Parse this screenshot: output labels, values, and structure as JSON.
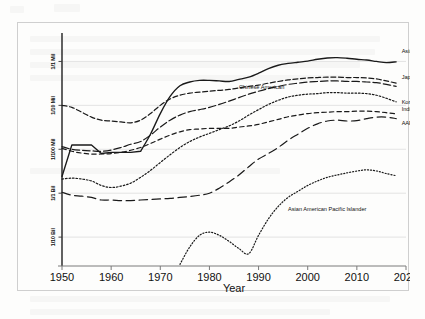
{
  "chart_data": {
    "type": "line",
    "title": "",
    "xlabel": "Year",
    "ylabel": "",
    "yscale": "log",
    "grid": true,
    "legend_position": "inline-right",
    "xlim": [
      1950,
      2020
    ],
    "xticks": [
      "1950",
      "1960",
      "1970",
      "1980",
      "1990",
      "2000",
      "2010",
      "2020"
    ],
    "yticks": [
      "1/1 Mil",
      "1/10 Mil",
      "1/100 Mil",
      "1/1 Bil",
      "1/10 Bil"
    ],
    "ytick_values": [
      1e-06,
      1e-07,
      1e-08,
      1e-09,
      1e-10
    ],
    "x": [
      1950,
      1952,
      1954,
      1956,
      1958,
      1960,
      1962,
      1964,
      1966,
      1968,
      1970,
      1972,
      1974,
      1976,
      1978,
      1980,
      1982,
      1984,
      1986,
      1988,
      1990,
      1992,
      1994,
      1996,
      1998,
      2000,
      2002,
      2004,
      2006,
      2008,
      2010,
      2012,
      2014,
      2016,
      2018
    ],
    "series": [
      {
        "name": "Asian American",
        "dash": "solid",
        "label_x": 2019,
        "values": [
          2.4e-09,
          1.25e-08,
          1.25e-08,
          1.25e-08,
          8e-09,
          8.5e-09,
          8.5e-09,
          8.5e-09,
          9e-09,
          2.2e-08,
          6.5e-08,
          1.6e-07,
          2.8e-07,
          3.4e-07,
          3.7e-07,
          3.7e-07,
          3.6e-07,
          3.5e-07,
          3.9e-07,
          4.4e-07,
          5.4e-07,
          6.9e-07,
          8.2e-07,
          9e-07,
          9.6e-07,
          1.02e-06,
          1.12e-06,
          1.2e-06,
          1.22e-06,
          1.18e-06,
          1.12e-06,
          1.08e-06,
          1e-06,
          9.4e-07,
          9.8e-07
        ]
      },
      {
        "name": "Chinese American",
        "dash": "dashed",
        "label_x": 1985,
        "values": [
          1e-07,
          9e-08,
          7e-08,
          5.4e-08,
          4.6e-08,
          4.4e-08,
          4.2e-08,
          4e-08,
          4.6e-08,
          6.5e-08,
          1e-07,
          1.4e-07,
          1.7e-07,
          1.9e-07,
          2e-07,
          2.1e-07,
          2.2e-07,
          2.3e-07,
          2.5e-07,
          2.7e-07,
          2.9e-07,
          3.2e-07,
          3.5e-07,
          3.8e-07,
          4e-07,
          4.2e-07,
          4.3e-07,
          4.4e-07,
          4.4e-07,
          4.3e-07,
          4.3e-07,
          4.2e-07,
          4e-07,
          3.6e-07,
          3.2e-07
        ]
      },
      {
        "name": "Japanese American",
        "dash": "longdash",
        "label_x": 2019,
        "values": [
          1.15e-08,
          1e-08,
          9.5e-09,
          9.2e-09,
          9e-09,
          9.6e-09,
          1.1e-08,
          1.3e-08,
          1.5e-08,
          2.1e-08,
          3.2e-08,
          4.6e-08,
          6e-08,
          7.2e-08,
          8e-08,
          9e-08,
          1.05e-07,
          1.25e-07,
          1.5e-07,
          1.8e-07,
          2.1e-07,
          2.4e-07,
          2.7e-07,
          3e-07,
          3.2e-07,
          3.4e-07,
          3.5e-07,
          3.6e-07,
          3.6e-07,
          3.5e-07,
          3.5e-07,
          3.4e-07,
          3.3e-07,
          3e-07,
          2.7e-07
        ]
      },
      {
        "name": "Korean American",
        "dash": "dotted-dense",
        "label_x": 2019,
        "values": [
          2.1e-09,
          2.2e-09,
          2.1e-09,
          1.9e-09,
          1.5e-09,
          1.35e-09,
          1.45e-09,
          1.7e-09,
          2.3e-09,
          3.3e-09,
          5e-09,
          7.5e-09,
          1.1e-08,
          1.5e-08,
          1.9e-08,
          2.3e-08,
          2.8e-08,
          3.4e-08,
          4.4e-08,
          6e-08,
          8e-08,
          1.05e-07,
          1.3e-07,
          1.55e-07,
          1.7e-07,
          1.8e-07,
          1.85e-07,
          1.95e-07,
          1.95e-07,
          1.9e-07,
          1.9e-07,
          1.85e-07,
          1.7e-07,
          1.45e-07,
          1.2e-07
        ]
      },
      {
        "name": "Indian American",
        "dash": "dashed-med",
        "label_x": 2019,
        "values": [
          1.05e-08,
          9e-09,
          8.2e-09,
          7.8e-09,
          7.8e-09,
          8e-09,
          8.5e-09,
          9.5e-09,
          1.1e-08,
          1.35e-08,
          1.7e-08,
          2.1e-08,
          2.5e-08,
          2.8e-08,
          2.9e-08,
          3e-08,
          3e-08,
          3e-08,
          3.2e-08,
          3.4e-08,
          3.7e-08,
          4.2e-08,
          4.8e-08,
          5.5e-08,
          6e-08,
          6.5e-08,
          6.8e-08,
          7e-08,
          7.2e-08,
          7.2e-08,
          7.4e-08,
          7.4e-08,
          7.2e-08,
          6.8e-08,
          6.4e-08
        ]
      },
      {
        "name": "AAPI",
        "dash": "longdash-sparse",
        "label_x": 2019,
        "values": [
          1.05e-09,
          9e-10,
          8.6e-10,
          8e-10,
          7e-10,
          7e-10,
          6.8e-10,
          6.8e-10,
          7e-10,
          7.2e-10,
          7.4e-10,
          7.6e-10,
          8e-10,
          8.4e-10,
          9e-10,
          1e-09,
          1.3e-09,
          1.8e-09,
          2.6e-09,
          4e-09,
          6e-09,
          8e-09,
          1.1e-08,
          1.6e-08,
          2.2e-08,
          3e-08,
          3.8e-08,
          4.4e-08,
          4.6e-08,
          4.4e-08,
          4.5e-08,
          5e-08,
          5.4e-08,
          5.4e-08,
          5e-08
        ]
      },
      {
        "name": "Asian American Pacific Islander",
        "dash": "dotted-fine",
        "label_x": 1998,
        "start_year": 1973,
        "values": [
          null,
          null,
          null,
          null,
          null,
          null,
          null,
          null,
          null,
          null,
          null,
          null,
          2.4e-11,
          6e-11,
          1.1e-10,
          1.3e-10,
          1.1e-10,
          8e-11,
          5.5e-11,
          4.2e-11,
          1.1e-10,
          2.6e-10,
          5e-10,
          8e-10,
          1.1e-09,
          1.5e-09,
          1.9e-09,
          2.3e-09,
          2.6e-09,
          2.9e-09,
          3.2e-09,
          3.4e-09,
          3.2e-09,
          2.8e-09,
          2.5e-09
        ]
      }
    ]
  },
  "axis": {
    "xtitle": "Year"
  }
}
